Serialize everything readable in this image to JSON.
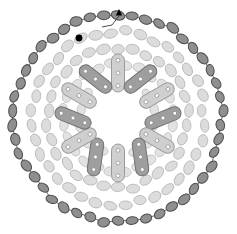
{
  "figure": {
    "caption": "",
    "background_color": "#ffffff",
    "width": 237,
    "height": 234,
    "center": {
      "x": 118,
      "y": 118
    },
    "symmetry_order": 12
  },
  "palette": {
    "outer_chain_fill": "#8f8f8f",
    "outer_chain_stroke": "#4d4d4d",
    "chain_link_line": "#5a5a5a",
    "mid_ellipse_fill": "#dcdcdc",
    "mid_ellipse_stroke": "#b4b4b4",
    "inner_ellipse_fill": "#e2e2e2",
    "inner_ellipse_stroke": "#bfbfbf",
    "rod_light_fill": "#cfcfcf",
    "rod_light_stroke": "#9a9a9a",
    "rod_dark_fill": "#9e9e9e",
    "rod_dark_stroke": "#6f6f6f",
    "rod_dot_fill": "#ffffff",
    "rod_dot_stroke": "#7d7d7d",
    "marker_dot": "#000000",
    "marker_arrow": "#000000"
  },
  "layers": {
    "outer_chain": {
      "name": "outer-subunit-chain",
      "count": 46,
      "radius": 104,
      "ellipse_rx": 6.2,
      "ellipse_ry": 4.3,
      "start_angle_deg": -90,
      "radial_wobble": 2.0,
      "description": "Chain of dark gray ellipsoidal subunits linked by thin connectors forming the outer shell"
    },
    "mid_ring": {
      "name": "mid-subunit-ring",
      "count": 36,
      "radius": 86,
      "ellipse_rx": 6.6,
      "ellipse_ry": 4.6,
      "start_angle_deg": -85,
      "description": "Light gray ellipsoidal subunits, outer annulus"
    },
    "mid_ring_b": {
      "name": "mid-subunit-ring-b",
      "count": 30,
      "radius": 70,
      "ellipse_rx": 6.6,
      "ellipse_ry": 4.6,
      "start_angle_deg": -78,
      "description": "Light gray ellipsoidal subunits, second annulus"
    },
    "inner_ring": {
      "name": "inner-subunit-ring",
      "count": 24,
      "radius": 54,
      "ellipse_rx": 6.4,
      "ellipse_ry": 4.4,
      "start_angle_deg": -82,
      "description": "Light gray ellipsoidal subunits, third annulus"
    },
    "core_ring": {
      "name": "core-subunit-ring",
      "count": 14,
      "radius": 38,
      "ellipse_rx": 6.0,
      "ellipse_ry": 4.2,
      "start_angle_deg": -90,
      "description": "Light gray ellipsoidal subunits bordering the empty lumen"
    },
    "radial_rods": {
      "name": "radial-rod-array",
      "count": 12,
      "inner_radius": 26,
      "outer_radius": 64,
      "rod_width": 13,
      "dots_per_rod": 3,
      "shade_pattern": [
        "light",
        "dark",
        "light",
        "dark",
        "light",
        "dark",
        "light",
        "dark",
        "light",
        "dark",
        "light",
        "dark"
      ],
      "tilt_pattern_deg": [
        0,
        22,
        0,
        -22,
        0,
        22,
        0,
        -22,
        0,
        22,
        0,
        -22
      ],
      "description": "Twelve capsule-shaped rods radiating from the central lumen, each carrying three white dots"
    }
  },
  "markers": [
    {
      "name": "filled-dot-marker",
      "shape": "filled-circle",
      "x": 79,
      "y": 38,
      "radius": 3.4,
      "color": "#000000",
      "label": ""
    },
    {
      "name": "arrow-marker",
      "shape": "small-arrow",
      "x": 119,
      "y": 14,
      "color": "#000000",
      "label": ""
    },
    {
      "name": "marker-leader-line",
      "shape": "polyline",
      "points": "119,16 112,25 102,27",
      "color": "#3a3a3a",
      "label": ""
    }
  ]
}
